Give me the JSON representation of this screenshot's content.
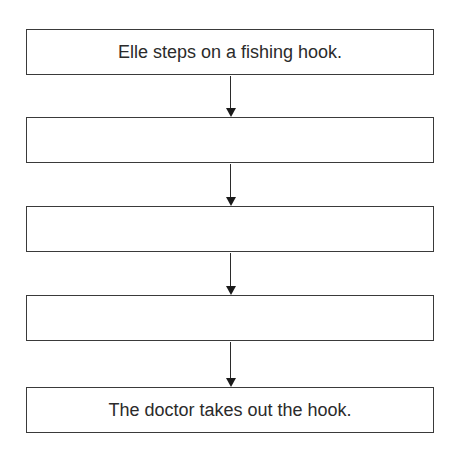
{
  "flowchart": {
    "boxes": [
      {
        "text": "Elle steps on a fishing hook."
      },
      {
        "text": ""
      },
      {
        "text": ""
      },
      {
        "text": ""
      },
      {
        "text": "The doctor takes out the hook."
      }
    ],
    "colors": {
      "border": "#3a3a3a",
      "text": "#2b2b2b",
      "background": "#ffffff"
    }
  }
}
